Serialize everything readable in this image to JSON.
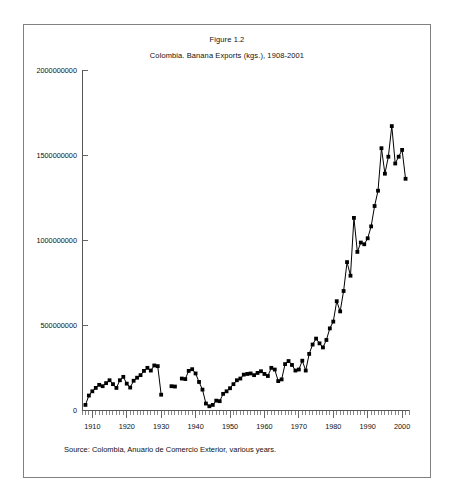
{
  "figure": {
    "number_label": "Figure 1.2",
    "subtitle": "Colombia. Banana Exports (kgs.), 1908-2001",
    "source_note": "Source: Colombia, Anuario de Comercio Exterior, various years."
  },
  "chart_data": {
    "type": "line",
    "title": "Colombia. Banana Exports (kgs.), 1908-2001",
    "xlabel": "",
    "ylabel": "",
    "xlim": [
      1907,
      2002
    ],
    "ylim": [
      0,
      2000000000
    ],
    "grid": false,
    "legend": "none",
    "marker": "square",
    "line_color": "#000000",
    "ytick_labels": [
      "0",
      "500000000",
      "1000000000",
      "1500000000",
      "2000000000"
    ],
    "ytick_values": [
      0,
      500000000,
      1000000000,
      1500000000,
      2000000000
    ],
    "xtick_labels": [
      "1910",
      "1920",
      "1930",
      "1940",
      "1950",
      "1960",
      "1970",
      "1980",
      "1990",
      "2000"
    ],
    "xtick_values": [
      1910,
      1920,
      1930,
      1940,
      1950,
      1960,
      1970,
      1980,
      1990,
      2000
    ],
    "x_minor_tick_step": 1,
    "x": [
      1908,
      1909,
      1910,
      1911,
      1912,
      1913,
      1914,
      1915,
      1916,
      1917,
      1918,
      1919,
      1920,
      1921,
      1922,
      1923,
      1924,
      1925,
      1926,
      1927,
      1928,
      1929,
      1930,
      1933,
      1934,
      1936,
      1937,
      1938,
      1939,
      1940,
      1941,
      1942,
      1943,
      1944,
      1945,
      1946,
      1947,
      1948,
      1949,
      1950,
      1951,
      1952,
      1953,
      1954,
      1955,
      1956,
      1957,
      1958,
      1959,
      1960,
      1961,
      1962,
      1963,
      1964,
      1965,
      1966,
      1967,
      1968,
      1969,
      1970,
      1971,
      1972,
      1973,
      1974,
      1975,
      1976,
      1977,
      1978,
      1979,
      1980,
      1981,
      1982,
      1983,
      1984,
      1985,
      1986,
      1987,
      1988,
      1989,
      1990,
      1991,
      1992,
      1993,
      1994,
      1995,
      1996,
      1997,
      1998,
      1999,
      2000,
      2001
    ],
    "values": [
      30000000,
      85000000,
      110000000,
      130000000,
      148000000,
      140000000,
      158000000,
      175000000,
      152000000,
      130000000,
      175000000,
      195000000,
      155000000,
      132000000,
      172000000,
      190000000,
      205000000,
      230000000,
      248000000,
      232000000,
      262000000,
      258000000,
      90000000,
      140000000,
      138000000,
      185000000,
      182000000,
      230000000,
      240000000,
      215000000,
      165000000,
      120000000,
      38000000,
      22000000,
      30000000,
      55000000,
      52000000,
      95000000,
      110000000,
      128000000,
      152000000,
      175000000,
      185000000,
      208000000,
      212000000,
      215000000,
      205000000,
      218000000,
      228000000,
      212000000,
      200000000,
      248000000,
      238000000,
      170000000,
      180000000,
      270000000,
      288000000,
      265000000,
      232000000,
      238000000,
      290000000,
      232000000,
      330000000,
      385000000,
      420000000,
      392000000,
      368000000,
      412000000,
      480000000,
      520000000,
      640000000,
      580000000,
      700000000,
      870000000,
      790000000,
      1130000000,
      930000000,
      985000000,
      975000000,
      1010000000,
      1080000000,
      1200000000,
      1290000000,
      1540000000,
      1390000000,
      1490000000,
      1670000000,
      1450000000,
      1490000000,
      1530000000,
      1360000000
    ]
  }
}
